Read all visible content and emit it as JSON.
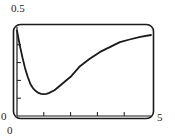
{
  "chart_data": {
    "type": "line",
    "title": "",
    "xlabel": "",
    "ylabel": "",
    "xlim": [
      0,
      5
    ],
    "ylim": [
      0,
      0.5
    ],
    "x_tick_labels": {
      "left": "0",
      "right": "5"
    },
    "y_tick_labels": {
      "bottom": "0",
      "top": "0.5"
    },
    "x_ticks": [
      1,
      2,
      3,
      4
    ],
    "y_ticks": [
      0.1,
      0.2,
      0.3,
      0.4
    ],
    "grid": false,
    "legend": null,
    "series": [
      {
        "name": "curve",
        "color": "#1a1a1a",
        "x": [
          0.0,
          0.05,
          0.1,
          0.2,
          0.3,
          0.4,
          0.5,
          0.6,
          0.7,
          0.8,
          0.9,
          1.0,
          1.1,
          1.2,
          1.4,
          1.6,
          1.8,
          2.0,
          2.35,
          2.7,
          3.1,
          3.5,
          3.84,
          4.2,
          4.6,
          5.0
        ],
        "y": [
          0.48,
          0.44,
          0.4,
          0.33,
          0.27,
          0.22,
          0.18,
          0.155,
          0.14,
          0.13,
          0.125,
          0.123,
          0.125,
          0.13,
          0.145,
          0.17,
          0.195,
          0.22,
          0.28,
          0.32,
          0.36,
          0.39,
          0.415,
          0.43,
          0.445,
          0.455
        ]
      }
    ]
  }
}
